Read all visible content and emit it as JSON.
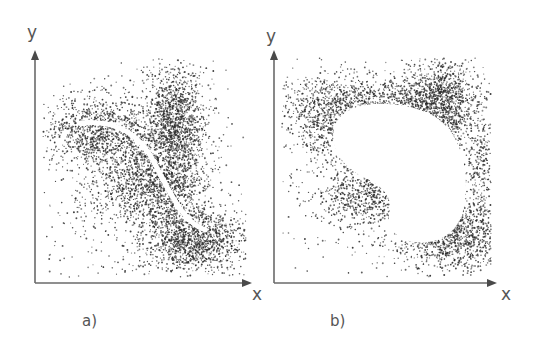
{
  "figure": {
    "width": 539,
    "height": 347,
    "background": "#ffffff",
    "dot_color": "#2b2b2b",
    "axis_color": "#6a6a6a",
    "label_color": "#555555"
  },
  "panels": [
    {
      "id": "a",
      "caption": "a)",
      "caption_pos": [
        82,
        326
      ],
      "x_axis_label": "x",
      "y_axis_label": "y",
      "origin": [
        35,
        283
      ],
      "x_axis_end": [
        252,
        283
      ],
      "y_axis_end": [
        35,
        50
      ],
      "y_label_pos": [
        27,
        38
      ],
      "x_label_pos": [
        252,
        300
      ],
      "overlay": {
        "type": "principal-curve",
        "description": "white S-shaped curve through the point cloud",
        "path": "M 80 123 C 110 120, 135 130, 150 155 C 165 182, 172 200, 185 215 C 192 224, 200 228, 205 230",
        "stroke_width": 5
      },
      "clusters": [
        {
          "cx": 100,
          "cy": 130,
          "sx": 30,
          "sy": 18,
          "n": 1100
        },
        {
          "cx": 175,
          "cy": 115,
          "sx": 16,
          "sy": 26,
          "n": 1100
        },
        {
          "cx": 140,
          "cy": 185,
          "sx": 26,
          "sy": 20,
          "n": 900
        },
        {
          "cx": 175,
          "cy": 175,
          "sx": 18,
          "sy": 30,
          "n": 700
        },
        {
          "cx": 195,
          "cy": 240,
          "sx": 24,
          "sy": 16,
          "n": 1200
        },
        {
          "cx": 140,
          "cy": 210,
          "sx": 55,
          "sy": 50,
          "n": 500
        }
      ]
    },
    {
      "id": "b",
      "caption": "b)",
      "caption_pos": [
        330,
        326
      ],
      "x_axis_label": "x",
      "y_axis_label": "y",
      "origin": [
        274,
        283
      ],
      "x_axis_end": [
        497,
        283
      ],
      "y_axis_end": [
        274,
        50
      ],
      "y_label_pos": [
        266,
        42
      ],
      "x_label_pos": [
        501,
        300
      ],
      "overlay": {
        "type": "void-region",
        "description": "white kidney-shaped empty region inside the point cloud",
        "path": "M 335 125 C 345 100, 390 100, 420 110 C 455 120, 470 160, 465 200 C 462 232, 440 245, 415 242 C 395 240, 385 225, 390 210 C 392 195, 380 185, 365 178 C 345 168, 328 150, 335 125 Z"
      },
      "clusters": [
        {
          "cx": 330,
          "cy": 120,
          "sx": 25,
          "sy": 22,
          "n": 900
        },
        {
          "cx": 440,
          "cy": 105,
          "sx": 18,
          "sy": 26,
          "n": 1200
        },
        {
          "cx": 390,
          "cy": 100,
          "sx": 40,
          "sy": 12,
          "n": 700
        },
        {
          "cx": 365,
          "cy": 195,
          "sx": 22,
          "sy": 14,
          "n": 600
        },
        {
          "cx": 450,
          "cy": 235,
          "sx": 30,
          "sy": 18,
          "n": 1300
        },
        {
          "cx": 480,
          "cy": 170,
          "sx": 8,
          "sy": 30,
          "n": 300
        },
        {
          "cx": 385,
          "cy": 175,
          "sx": 70,
          "sy": 60,
          "n": 500
        }
      ]
    }
  ]
}
